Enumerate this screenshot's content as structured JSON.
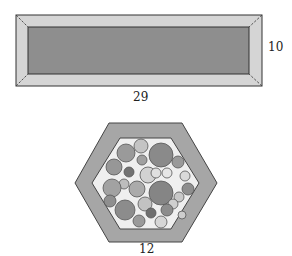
{
  "figure_1": {
    "shape": "rectangular frame",
    "width_label": "29",
    "height_label": "10",
    "colors": {
      "frame": "#d5d5d5",
      "inner": "#8e8e8e",
      "stroke": "#333333"
    },
    "outer": {
      "x": 16,
      "y": 15,
      "w": 246,
      "h": 71
    },
    "inner": {
      "x": 28,
      "y": 27,
      "w": 221,
      "h": 47
    }
  },
  "figure_2": {
    "shape": "hexagonal frame with circles",
    "side_label": "12",
    "colors": {
      "frame": "#a6a6a6",
      "inner": "#efefef",
      "stroke": "#444444"
    },
    "outer_points": "109,123 182,123 217,183 182,242 109,242 75,183",
    "inner_points": "120,138 171,138 199,183 171,229 120,229 92,183",
    "circles": [
      {
        "cx": 141,
        "cy": 146,
        "r": 7,
        "fill": "#c4c4c4"
      },
      {
        "cx": 126,
        "cy": 153,
        "r": 9,
        "fill": "#9a9a9a"
      },
      {
        "cx": 161,
        "cy": 155,
        "r": 12,
        "fill": "#8a8a8a"
      },
      {
        "cx": 142,
        "cy": 160,
        "r": 5,
        "fill": "#a0a0a0"
      },
      {
        "cx": 178,
        "cy": 162,
        "r": 6,
        "fill": "#9a9a9a"
      },
      {
        "cx": 114,
        "cy": 167,
        "r": 8,
        "fill": "#979797"
      },
      {
        "cx": 129,
        "cy": 172,
        "r": 5,
        "fill": "#727272"
      },
      {
        "cx": 148,
        "cy": 175,
        "r": 8,
        "fill": "#d2d2d2"
      },
      {
        "cx": 156,
        "cy": 173,
        "r": 5,
        "fill": "#e0e0e0"
      },
      {
        "cx": 167,
        "cy": 173,
        "r": 5,
        "fill": "#e6e6e6"
      },
      {
        "cx": 185,
        "cy": 176,
        "r": 5,
        "fill": "#dadada"
      },
      {
        "cx": 124,
        "cy": 184,
        "r": 5,
        "fill": "#bdbdbd"
      },
      {
        "cx": 112,
        "cy": 188,
        "r": 9,
        "fill": "#a2a2a2"
      },
      {
        "cx": 137,
        "cy": 189,
        "r": 8,
        "fill": "#ababab"
      },
      {
        "cx": 161,
        "cy": 193,
        "r": 12,
        "fill": "#858585"
      },
      {
        "cx": 188,
        "cy": 189,
        "r": 6,
        "fill": "#8e8e8e"
      },
      {
        "cx": 179,
        "cy": 197,
        "r": 5,
        "fill": "#c8c8c8"
      },
      {
        "cx": 110,
        "cy": 201,
        "r": 6,
        "fill": "#8f8f8f"
      },
      {
        "cx": 145,
        "cy": 204,
        "r": 7,
        "fill": "#c2c2c2"
      },
      {
        "cx": 173,
        "cy": 204,
        "r": 5,
        "fill": "#cfcfcf"
      },
      {
        "cx": 125,
        "cy": 210,
        "r": 10,
        "fill": "#8c8c8c"
      },
      {
        "cx": 151,
        "cy": 213,
        "r": 5,
        "fill": "#6f6f6f"
      },
      {
        "cx": 167,
        "cy": 210,
        "r": 6,
        "fill": "#8d8d8d"
      },
      {
        "cx": 182,
        "cy": 215,
        "r": 4,
        "fill": "#cdcdcd"
      },
      {
        "cx": 139,
        "cy": 221,
        "r": 6,
        "fill": "#9a9a9a"
      },
      {
        "cx": 161,
        "cy": 222,
        "r": 6,
        "fill": "#d6d6d6"
      }
    ]
  }
}
